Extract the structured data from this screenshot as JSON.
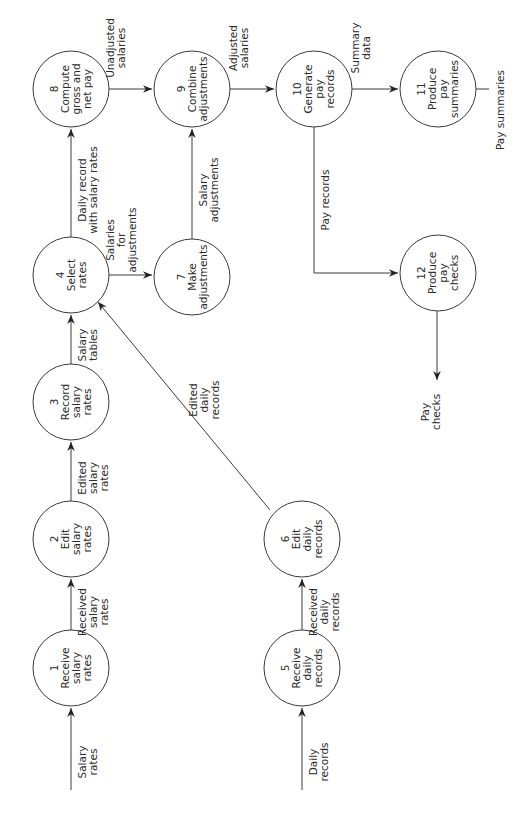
{
  "diagram": {
    "type": "data-flow-diagram",
    "orientation": "rotated-90-ccw",
    "colors": {
      "line": "#3a3a3a",
      "text": "#2a2a2a",
      "background": "#ffffff"
    },
    "processes": [
      {
        "id": "1",
        "number": "1",
        "lines": [
          "Receive",
          "salary",
          "rates"
        ],
        "cx": 71,
        "cy": 668,
        "r": 38
      },
      {
        "id": "2",
        "number": "2",
        "lines": [
          "Edit",
          "salary",
          "rates"
        ],
        "cx": 71,
        "cy": 539,
        "r": 38
      },
      {
        "id": "3",
        "number": "3",
        "lines": [
          "Record",
          "salary",
          "rates"
        ],
        "cx": 71,
        "cy": 402,
        "r": 38
      },
      {
        "id": "4",
        "number": "4",
        "lines": [
          "Select",
          "rates"
        ],
        "cx": 71,
        "cy": 275,
        "r": 38
      },
      {
        "id": "5",
        "number": "5",
        "lines": [
          "Receive",
          "daily",
          "records"
        ],
        "cx": 302,
        "cy": 668,
        "r": 38
      },
      {
        "id": "6",
        "number": "6",
        "lines": [
          "Edit",
          "daily",
          "records"
        ],
        "cx": 302,
        "cy": 539,
        "r": 38
      },
      {
        "id": "7",
        "number": "7",
        "lines": [
          "Make",
          "adjustments"
        ],
        "cx": 192,
        "cy": 277,
        "r": 38
      },
      {
        "id": "8",
        "number": "8",
        "lines": [
          "Compute",
          "gross and",
          "net pay"
        ],
        "cx": 71,
        "cy": 89,
        "r": 38
      },
      {
        "id": "9",
        "number": "9",
        "lines": [
          "Combine",
          "adjustments"
        ],
        "cx": 192,
        "cy": 89,
        "r": 38
      },
      {
        "id": "10",
        "number": "10",
        "lines": [
          "Generate",
          "pay",
          "records"
        ],
        "cx": 314,
        "cy": 89,
        "r": 38
      },
      {
        "id": "11",
        "number": "11",
        "lines": [
          "Produce",
          "pay",
          "summaries"
        ],
        "cx": 438,
        "cy": 89,
        "r": 38
      },
      {
        "id": "12",
        "number": "12",
        "lines": [
          "Produce",
          "pay",
          "checks"
        ],
        "cx": 438,
        "cy": 273,
        "r": 38
      }
    ],
    "flows": [
      {
        "id": "salary-rates",
        "from": "external",
        "to": "1",
        "lines": [
          "Salary",
          "rates"
        ],
        "points": [
          [
            71,
            790
          ],
          [
            71,
            708
          ]
        ],
        "arrow": true,
        "label_x": 82,
        "label_y": 762
      },
      {
        "id": "received-salary-rates",
        "from": "1",
        "to": "2",
        "lines": [
          "Received",
          "salary",
          "rates"
        ],
        "points": [
          [
            71,
            630
          ],
          [
            71,
            579
          ]
        ],
        "arrow": true,
        "label_x": 82,
        "label_y": 612
      },
      {
        "id": "edited-salary-rates",
        "from": "2",
        "to": "3",
        "lines": [
          "Edited",
          "salary",
          "rates"
        ],
        "points": [
          [
            71,
            501
          ],
          [
            71,
            442
          ]
        ],
        "arrow": true,
        "label_x": 82,
        "label_y": 478
      },
      {
        "id": "salary-tables",
        "from": "3",
        "to": "4",
        "lines": [
          "Salary",
          "tables"
        ],
        "points": [
          [
            71,
            364
          ],
          [
            71,
            315
          ]
        ],
        "arrow": true,
        "label_x": 82,
        "label_y": 345
      },
      {
        "id": "salaries-for-adjustments",
        "from": "4",
        "to": "7",
        "lines": [
          "Salaries",
          "for",
          "adjustments"
        ],
        "points": [
          [
            109,
            275
          ],
          [
            152,
            275
          ]
        ],
        "arrow": true,
        "label_x": 110,
        "label_y": 240
      },
      {
        "id": "daily-record-with-salary-rates",
        "from": "4",
        "to": "8",
        "lines": [
          "Daily record",
          "with salary rates"
        ],
        "points": [
          [
            71,
            237
          ],
          [
            71,
            129
          ]
        ],
        "arrow": true,
        "label_x": 82,
        "label_y": 190
      },
      {
        "id": "salary-adjustments",
        "from": "7",
        "to": "9",
        "lines": [
          "Salary",
          "adjustments"
        ],
        "points": [
          [
            192,
            239
          ],
          [
            192,
            129
          ]
        ],
        "arrow": true,
        "label_x": 203,
        "label_y": 190
      },
      {
        "id": "unadjusted-salaries",
        "from": "8",
        "to": "9",
        "lines": [
          "Unadjusted",
          "salaries"
        ],
        "points": [
          [
            109,
            89
          ],
          [
            152,
            89
          ]
        ],
        "arrow": true,
        "label_x": 110,
        "label_y": 48
      },
      {
        "id": "adjusted-salaries",
        "from": "9",
        "to": "10",
        "lines": [
          "Adjusted",
          "salaries"
        ],
        "points": [
          [
            230,
            89
          ],
          [
            274,
            89
          ]
        ],
        "arrow": true,
        "label_x": 233,
        "label_y": 48
      },
      {
        "id": "summary-data",
        "from": "10",
        "to": "11",
        "lines": [
          "Summary",
          "data"
        ],
        "points": [
          [
            352,
            89
          ],
          [
            398,
            89
          ]
        ],
        "arrow": true,
        "label_x": 355,
        "label_y": 48
      },
      {
        "id": "pay-summaries",
        "from": "11",
        "to": "external",
        "lines": [
          "Pay summaries"
        ],
        "points": [
          [
            476,
            89
          ],
          [
            489,
            89
          ]
        ],
        "arrow": false,
        "label_x": 500,
        "label_y": 110
      },
      {
        "id": "pay-records",
        "from": "10",
        "to": "12",
        "lines": [
          "Pay records"
        ],
        "points": [
          [
            314,
            127
          ],
          [
            314,
            273
          ],
          [
            398,
            273
          ]
        ],
        "arrow": true,
        "label_x": 325,
        "label_y": 200
      },
      {
        "id": "pay-checks",
        "from": "12",
        "to": "external",
        "lines": [
          "Pay",
          "checks"
        ],
        "points": [
          [
            437,
            311
          ],
          [
            437,
            380
          ]
        ],
        "arrow": true,
        "label_x": 425,
        "label_y": 412
      },
      {
        "id": "daily-records",
        "from": "external",
        "to": "5",
        "lines": [
          "Daily",
          "records"
        ],
        "points": [
          [
            302,
            790
          ],
          [
            302,
            708
          ]
        ],
        "arrow": true,
        "label_x": 313,
        "label_y": 762
      },
      {
        "id": "received-daily-records",
        "from": "5",
        "to": "6",
        "lines": [
          "Received",
          "daily",
          "records"
        ],
        "points": [
          [
            302,
            630
          ],
          [
            302,
            579
          ]
        ],
        "arrow": true,
        "label_x": 313,
        "label_y": 612
      },
      {
        "id": "edited-daily-records",
        "from": "6",
        "to": "4",
        "lines": [
          "Edited",
          "daily",
          "records"
        ],
        "points": [
          [
            270,
            510
          ],
          [
            98,
            302
          ]
        ],
        "arrow": true,
        "label_x": 193,
        "label_y": 400
      }
    ]
  }
}
